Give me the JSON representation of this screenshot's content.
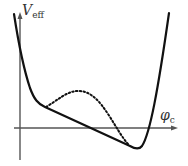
{
  "diagram": {
    "title": "",
    "y_axis": {
      "symbol": "V",
      "subscript": "eff"
    },
    "x_axis": {
      "symbol": "φ",
      "subscript": "c"
    },
    "curves": [
      {
        "name": "effective-potential-solid",
        "style": "solid"
      },
      {
        "name": "effective-potential-dotted",
        "style": "dotted"
      }
    ],
    "colors": {
      "curve": "#111111",
      "axis": "#555555",
      "text": "#333333"
    }
  }
}
